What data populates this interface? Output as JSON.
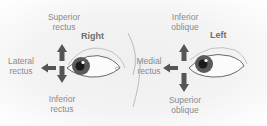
{
  "diagram": {
    "right_eye": {
      "side_label": "Right",
      "up": {
        "line1": "Superior",
        "line2": "rectus"
      },
      "lateral": {
        "line1": "Lateral",
        "line2": "rectus"
      },
      "down": {
        "line1": "Inferior",
        "line2": "rectus"
      }
    },
    "left_eye": {
      "side_label": "Left",
      "up": {
        "line1": "Inferior",
        "line2": "oblique"
      },
      "medial": {
        "line1": "Medial",
        "line2": "rectus"
      },
      "down": {
        "line1": "Superior",
        "line2": "oblique"
      }
    },
    "colors": {
      "arrow": "#555555",
      "iris": "#5a5a5a",
      "pupil": "#1a1a1a",
      "label": "#8a8a8a",
      "outline": "#9a9a9a"
    }
  }
}
